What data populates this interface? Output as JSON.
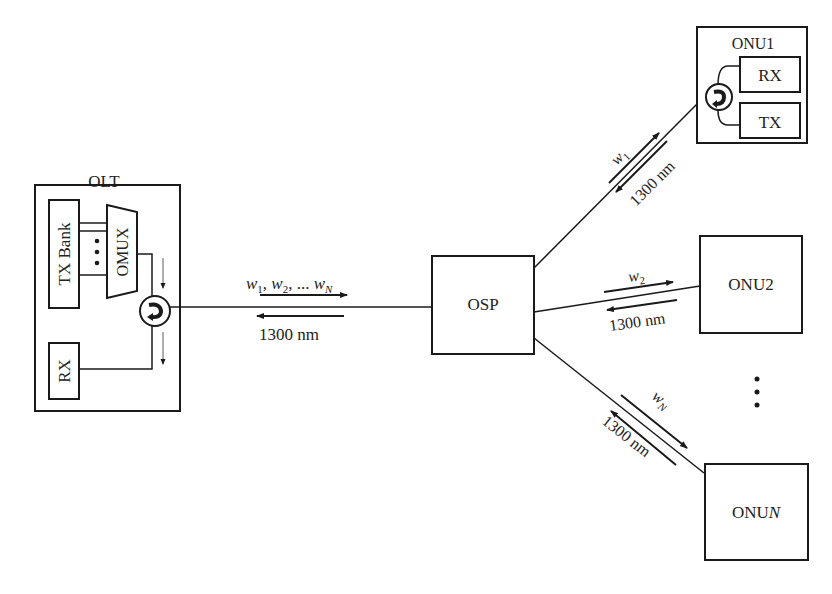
{
  "diagram": {
    "type": "WDM-PON architecture",
    "colors": {
      "stroke": "#1a1a1a",
      "text": "#222222",
      "background": "#ffffff"
    },
    "olt": {
      "title": "OLT",
      "tx_bank": "TX Bank",
      "omux": "OMUX",
      "rx": "RX",
      "circulator": "circulator-icon"
    },
    "feeder": {
      "downstream": "w1, w2, ... wN",
      "downstream_parts": {
        "w": "w",
        "s1": "1",
        "s2": "2",
        "sN": "N",
        "sep": ", ",
        "dots": "... "
      },
      "upstream": "1300 nm"
    },
    "osp": {
      "label": "OSP"
    },
    "branches": [
      {
        "downstream": "w1",
        "w": "w",
        "sub": "1",
        "upstream": "1300 nm"
      },
      {
        "downstream": "w2",
        "w": "w",
        "sub": "2",
        "upstream": "1300 nm"
      },
      {
        "downstream": "wN",
        "w": "w",
        "sub": "N",
        "upstream": "1300 nm"
      }
    ],
    "onus": [
      {
        "label": "ONU1",
        "rx": "RX",
        "tx": "TX"
      },
      {
        "label": "ONU2"
      },
      {
        "label_prefix": "ONU",
        "label_suffix": "N",
        "label": "ONUN"
      }
    ],
    "ellipsis": "⋮"
  }
}
